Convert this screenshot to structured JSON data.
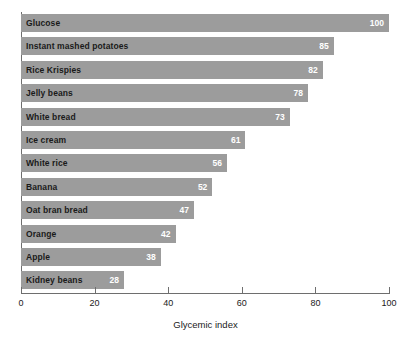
{
  "chart_data": {
    "type": "bar",
    "orientation": "horizontal",
    "title": "",
    "xlabel": "Glycemic index",
    "ylabel": "",
    "xlim": [
      0,
      100
    ],
    "xticks": [
      0,
      20,
      40,
      60,
      80,
      100
    ],
    "grid": false,
    "legend": null,
    "bar_color": "#9c9c9c",
    "value_label_color": "#ffffff",
    "category_label_color": "#1a1a1a",
    "categories": [
      "Glucose",
      "Instant mashed potatoes",
      "Rice Krispies",
      "Jelly beans",
      "White bread",
      "Ice cream",
      "White rice",
      "Banana",
      "Oat bran bread",
      "Orange",
      "Apple",
      "Kidney beans"
    ],
    "values": [
      100,
      85,
      82,
      78,
      73,
      61,
      56,
      52,
      47,
      42,
      38,
      28
    ],
    "bars": [
      {
        "category": "Glucose",
        "value": 100,
        "value_label": "100"
      },
      {
        "category": "Instant mashed potatoes",
        "value": 85,
        "value_label": "85"
      },
      {
        "category": "Rice Krispies",
        "value": 82,
        "value_label": "82"
      },
      {
        "category": "Jelly beans",
        "value": 78,
        "value_label": "78"
      },
      {
        "category": "White bread",
        "value": 73,
        "value_label": "73"
      },
      {
        "category": "Ice cream",
        "value": 61,
        "value_label": "61"
      },
      {
        "category": "White rice",
        "value": 56,
        "value_label": "56"
      },
      {
        "category": "Banana",
        "value": 52,
        "value_label": "52"
      },
      {
        "category": "Oat bran bread",
        "value": 47,
        "value_label": "47"
      },
      {
        "category": "Orange",
        "value": 42,
        "value_label": "42"
      },
      {
        "category": "Apple",
        "value": 38,
        "value_label": "38"
      },
      {
        "category": "Kidney beans",
        "value": 28,
        "value_label": "28"
      }
    ]
  }
}
